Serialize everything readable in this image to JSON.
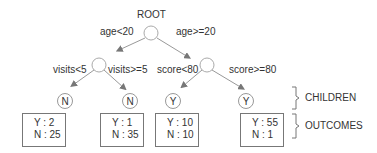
{
  "root": {
    "label": "ROOT"
  },
  "edges": {
    "root_left": "age<20",
    "root_right": "age>=20",
    "left_left": "visits<5",
    "left_right": "visits>=5",
    "right_left": "score<80",
    "right_right": "score>=80"
  },
  "leaves": [
    {
      "class": "N",
      "outcome_y": "Y : 2",
      "outcome_n": "N : 25"
    },
    {
      "class": "N",
      "outcome_y": "Y : 1",
      "outcome_n": "N : 35"
    },
    {
      "class": "Y",
      "outcome_y": "Y : 10",
      "outcome_n": "N : 10"
    },
    {
      "class": "Y",
      "outcome_y": "Y : 55",
      "outcome_n": "N : 1"
    }
  ],
  "legend": {
    "children": "CHILDREN",
    "outcomes": "OUTCOMES"
  },
  "colors": {
    "line": "#999999",
    "arrow": "#777777",
    "text": "#333333"
  }
}
